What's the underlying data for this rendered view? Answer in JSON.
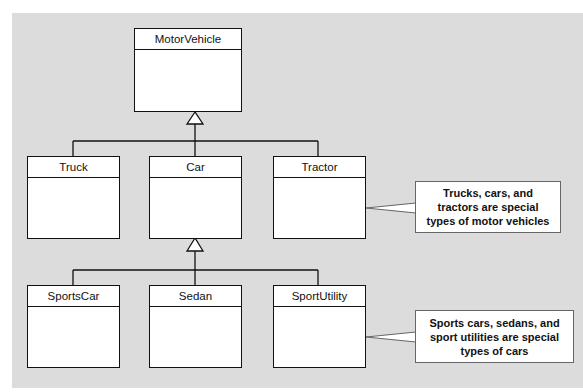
{
  "diagram": {
    "type": "uml-class-inheritance",
    "classes": {
      "root": {
        "name": "MotorVehicle"
      },
      "level1": [
        {
          "name": "Truck"
        },
        {
          "name": "Car"
        },
        {
          "name": "Tractor"
        }
      ],
      "level2": [
        {
          "name": "SportsCar"
        },
        {
          "name": "Sedan"
        },
        {
          "name": "SportUtility"
        }
      ]
    },
    "relationships": [
      {
        "child": "Truck",
        "parent": "MotorVehicle",
        "kind": "generalization"
      },
      {
        "child": "Car",
        "parent": "MotorVehicle",
        "kind": "generalization"
      },
      {
        "child": "Tractor",
        "parent": "MotorVehicle",
        "kind": "generalization"
      },
      {
        "child": "SportsCar",
        "parent": "Car",
        "kind": "generalization"
      },
      {
        "child": "Sedan",
        "parent": "Car",
        "kind": "generalization"
      },
      {
        "child": "SportUtility",
        "parent": "Car",
        "kind": "generalization"
      }
    ],
    "callouts": [
      {
        "text": "Trucks, cars, and tractors are special types of motor vehicles",
        "points_to": "Tractor"
      },
      {
        "text": "Sports cars, sedans, and sport utilities are special types of cars",
        "points_to": "SportUtility"
      }
    ],
    "colors": {
      "background": "#dcdcdc",
      "box_fill": "#ffffff",
      "line": "#111111"
    }
  }
}
